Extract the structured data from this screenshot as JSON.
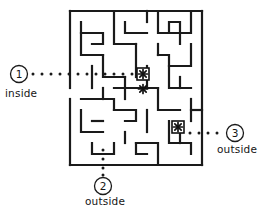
{
  "figure": {
    "kind": "maze-inside-outside-puzzle",
    "background_color": "#ffffff",
    "wall_color": "#1a1a1a",
    "dot_color": "#1a1a1a",
    "marker_color": "#111111",
    "label_color": "#151515",
    "wall_thickness": 2.2,
    "view": {
      "width": 265,
      "height": 216
    }
  },
  "markers": {
    "asterisks": [
      {
        "name": "asterisk-top",
        "x": 143,
        "y": 74,
        "size": 9,
        "boxed": true
      },
      {
        "name": "asterisk-middle",
        "x": 143,
        "y": 89,
        "size": 9,
        "boxed": false
      },
      {
        "name": "asterisk-lower-right",
        "x": 178,
        "y": 127,
        "size": 9,
        "boxed": true
      }
    ]
  },
  "callouts": [
    {
      "id": "1",
      "name": "callout-1",
      "number": "1",
      "label": "inside",
      "circle": {
        "cx": 19,
        "cy": 74,
        "r": 8.5
      },
      "dots": [
        {
          "x": 33,
          "y": 74
        },
        {
          "x": 42,
          "y": 74
        },
        {
          "x": 51,
          "y": 74
        },
        {
          "x": 60,
          "y": 74
        },
        {
          "x": 69,
          "y": 74
        },
        {
          "x": 78,
          "y": 74
        },
        {
          "x": 87,
          "y": 74
        },
        {
          "x": 96,
          "y": 74
        },
        {
          "x": 105,
          "y": 74
        },
        {
          "x": 114,
          "y": 74
        },
        {
          "x": 123,
          "y": 74
        },
        {
          "x": 132,
          "y": 74
        }
      ]
    },
    {
      "id": "2",
      "name": "callout-2",
      "number": "2",
      "label": "outside",
      "circle": {
        "cx": 103,
        "cy": 186,
        "r": 8.5
      },
      "dots": [
        {
          "x": 103,
          "y": 150
        },
        {
          "x": 103,
          "y": 159
        },
        {
          "x": 103,
          "y": 168
        },
        {
          "x": 103,
          "y": 175
        }
      ]
    },
    {
      "id": "3",
      "name": "callout-3",
      "number": "3",
      "label": "outside",
      "circle": {
        "cx": 235,
        "cy": 133,
        "r": 8.5
      },
      "dots": [
        {
          "x": 190,
          "y": 133
        },
        {
          "x": 199,
          "y": 133
        },
        {
          "x": 208,
          "y": 133
        },
        {
          "x": 217,
          "y": 133
        }
      ]
    }
  ],
  "maze": {
    "origin": {
      "x": 70,
      "y": 11
    },
    "cell": 11,
    "cols": 12,
    "rows": 14,
    "walls": [
      "M70,11 L70,88",
      "M70,99 L70,165",
      "M70,165 L202,165",
      "M202,165 L202,11",
      "M202,11 L70,11",
      "M81,22 L81,55 L103,55",
      "M81,33 L103,33 L103,44 L92,44",
      "M114,11 L114,44 L136,44",
      "M125,22 L125,33 L147,33",
      "M147,11 L147,22",
      "M158,11 L158,33 L169,33 L169,22 L180,22 L180,44",
      "M191,11 L191,33 L169,33",
      "M136,44 L136,77",
      "M103,55 L103,77 L125,77",
      "M92,66 L92,88",
      "M191,44 L191,66 L169,66 L169,55 L158,55",
      "M158,44 L158,55",
      "M169,66 L169,88 L191,88",
      "M147,66 L147,88",
      "M125,77 L125,99",
      "M114,88 L158,88",
      "M158,88 L158,110 L180,110",
      "M81,99 L114,99 L114,110",
      "M81,110 L81,132 L103,132",
      "M92,121 L103,121",
      "M114,110 L136,110 L136,121 L125,121",
      "M147,110 L147,132",
      "M125,132 L125,143",
      "M191,99 L191,121",
      "M202,110 L191,110",
      "M169,121 L169,143 L191,143 L191,154",
      "M92,143 L92,154 L114,154 L114,143",
      "M136,143 L158,143 L158,165",
      "M136,143 L136,154 L147,154",
      "M180,132 L180,143",
      "M103,88 L103,99",
      "M180,77 L180,88"
    ]
  }
}
